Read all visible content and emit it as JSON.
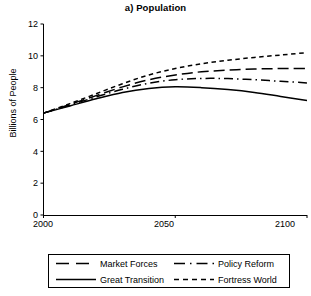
{
  "chart_data": {
    "type": "line",
    "title": "a) Population",
    "xlabel": "",
    "ylabel": "Billions of People",
    "xlim": [
      2000,
      2100
    ],
    "ylim": [
      0,
      12
    ],
    "xticks": [
      "2000",
      "2050",
      "2100"
    ],
    "yticks": [
      "0",
      "2",
      "4",
      "6",
      "8",
      "10",
      "12"
    ],
    "grid": false,
    "legend_position": "below-plot",
    "x": [
      2000,
      2010,
      2020,
      2030,
      2040,
      2050,
      2060,
      2070,
      2080,
      2090,
      2100
    ],
    "series": [
      {
        "name": "Market Forces",
        "style": "long-dash",
        "values": [
          6.4,
          6.95,
          7.5,
          8.05,
          8.5,
          8.8,
          9.0,
          9.1,
          9.17,
          9.2,
          9.2
        ]
      },
      {
        "name": "Great Transition",
        "style": "solid",
        "values": [
          6.4,
          6.85,
          7.3,
          7.7,
          7.95,
          8.05,
          8.0,
          7.88,
          7.7,
          7.45,
          7.2
        ]
      },
      {
        "name": "Policy Reform",
        "style": "dash-dot",
        "values": [
          6.4,
          6.9,
          7.42,
          7.9,
          8.28,
          8.5,
          8.58,
          8.57,
          8.5,
          8.4,
          8.3
        ]
      },
      {
        "name": "Fortress World",
        "style": "short-dash",
        "values": [
          6.4,
          7.0,
          7.62,
          8.25,
          8.8,
          9.2,
          9.5,
          9.72,
          9.9,
          10.05,
          10.2
        ]
      }
    ]
  },
  "legend": {
    "entries": [
      {
        "label": "Market Forces",
        "style": "long-dash"
      },
      {
        "label": "Policy Reform",
        "style": "dash-dot"
      },
      {
        "label": "Great Transition",
        "style": "solid"
      },
      {
        "label": "Fortress World",
        "style": "short-dash"
      }
    ]
  },
  "colors": {
    "ink": "#000000",
    "background": "#ffffff"
  }
}
